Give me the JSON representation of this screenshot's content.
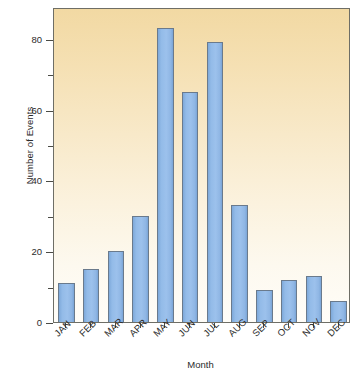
{
  "chart_data": {
    "type": "bar",
    "title": "",
    "subtitle": "",
    "xlabel": "Month",
    "ylabel": "Number of Events",
    "categories": [
      "JAN",
      "FEB",
      "MAR",
      "APR",
      "MAY",
      "JUN",
      "JUL",
      "AUG",
      "SEP",
      "OCT",
      "NOV",
      "DEC"
    ],
    "values": [
      11,
      15,
      20,
      30,
      83,
      65,
      79,
      33,
      9,
      12,
      13,
      6
    ],
    "series": [
      {
        "name": "Number of Events",
        "values": [
          11,
          15,
          20,
          30,
          83,
          65,
          79,
          33,
          9,
          12,
          13,
          6
        ]
      }
    ],
    "ylim": [
      0,
      89
    ],
    "xlim": [
      0,
      12
    ],
    "y_major_ticks": [
      0,
      20,
      40,
      60,
      80
    ],
    "y_minor_ticks": [
      10,
      30,
      50,
      70
    ],
    "y_tick_labels": [
      "0",
      "20",
      "40",
      "60",
      "80"
    ],
    "grid": false,
    "legend": false,
    "legend_position": "none",
    "orientation": "vertical",
    "bar_color": "#93bbe8",
    "bar_edge_color": "#6a7a8c",
    "plot_background_top": "#f2d9a3",
    "plot_background_bottom": "#fffdf8",
    "frame_color": "#6e6e66",
    "text_color": "#2b2b2b",
    "x_tick_label_rotation": -45
  },
  "axes": {
    "y_title": "Number of Events",
    "x_title": "Month"
  }
}
